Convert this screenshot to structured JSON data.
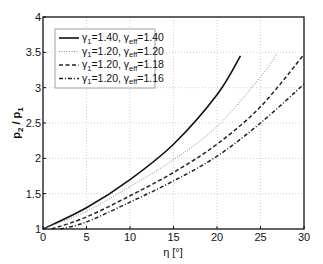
{
  "chart_data": {
    "type": "line",
    "title": "",
    "xlabel": "η [°]",
    "ylabel": "p2 / p1",
    "xlim": [
      0,
      30
    ],
    "ylim": [
      1,
      4
    ],
    "xticks": [
      0,
      5,
      10,
      15,
      20,
      25,
      30
    ],
    "yticks": [
      1,
      1.5,
      2,
      2.5,
      3,
      3.5,
      4
    ],
    "xtick_labels": [
      "0",
      "5",
      "10",
      "15",
      "20",
      "25",
      "30"
    ],
    "ytick_labels": [
      "1",
      "1.5",
      "2",
      "2.5",
      "3",
      "3.5",
      "4"
    ],
    "grid": true,
    "legend_position": "upper left",
    "series": [
      {
        "name": "γ1=1.40, γeff=1.40",
        "gamma_1": "1.40",
        "gamma_eff": "1.40",
        "style": "solid",
        "color": "#111111",
        "x": [
          0,
          5,
          10,
          15,
          20,
          22.7
        ],
        "y": [
          1.0,
          1.3,
          1.7,
          2.2,
          2.9,
          3.45
        ]
      },
      {
        "name": "γ1=1.20, γeff=1.20",
        "gamma_1": "1.20",
        "gamma_eff": "1.20",
        "style": "dotted",
        "color": "#8a8a8a",
        "x": [
          0,
          5,
          10,
          15,
          20,
          25,
          26.9
        ],
        "y": [
          1.0,
          1.25,
          1.6,
          1.98,
          2.45,
          3.15,
          3.48
        ]
      },
      {
        "name": "γ1=1.20, γeff=1.18",
        "gamma_1": "1.20",
        "gamma_eff": "1.18",
        "style": "dashed",
        "color": "#222222",
        "x": [
          1,
          5,
          10,
          15,
          20,
          25,
          30
        ],
        "y": [
          1.0,
          1.17,
          1.47,
          1.8,
          2.2,
          2.73,
          3.47
        ]
      },
      {
        "name": "γ1=1.20, γeff=1.16",
        "gamma_1": "1.20",
        "gamma_eff": "1.16",
        "style": "dashdot",
        "color": "#222222",
        "x": [
          2,
          5,
          10,
          15,
          20,
          25,
          30
        ],
        "y": [
          1.0,
          1.1,
          1.38,
          1.68,
          2.03,
          2.5,
          3.05
        ]
      }
    ]
  },
  "axes": {
    "xlabel_main": "η",
    "xlabel_unit": "[°]",
    "ylabel_p": "p",
    "ylabel_sub2": "2",
    "ylabel_slash": " / ",
    "ylabel_sub1": "1"
  },
  "legend": {
    "entries": [
      {
        "g1_sym": "γ",
        "g1_sub": "1",
        "g1_val": "=1.40, ",
        "ge_sym": "γ",
        "ge_sub": "eff",
        "ge_val": "=1.40"
      },
      {
        "g1_sym": "γ",
        "g1_sub": "1",
        "g1_val": "=1.20, ",
        "ge_sym": "γ",
        "ge_sub": "eff",
        "ge_val": "=1.20"
      },
      {
        "g1_sym": "γ",
        "g1_sub": "1",
        "g1_val": "=1.20, ",
        "ge_sym": "γ",
        "ge_sub": "eff",
        "ge_val": "=1.18"
      },
      {
        "g1_sym": "γ",
        "g1_sub": "1",
        "g1_val": "=1.20, ",
        "ge_sym": "γ",
        "ge_sub": "eff",
        "ge_val": "=1.16"
      }
    ]
  }
}
